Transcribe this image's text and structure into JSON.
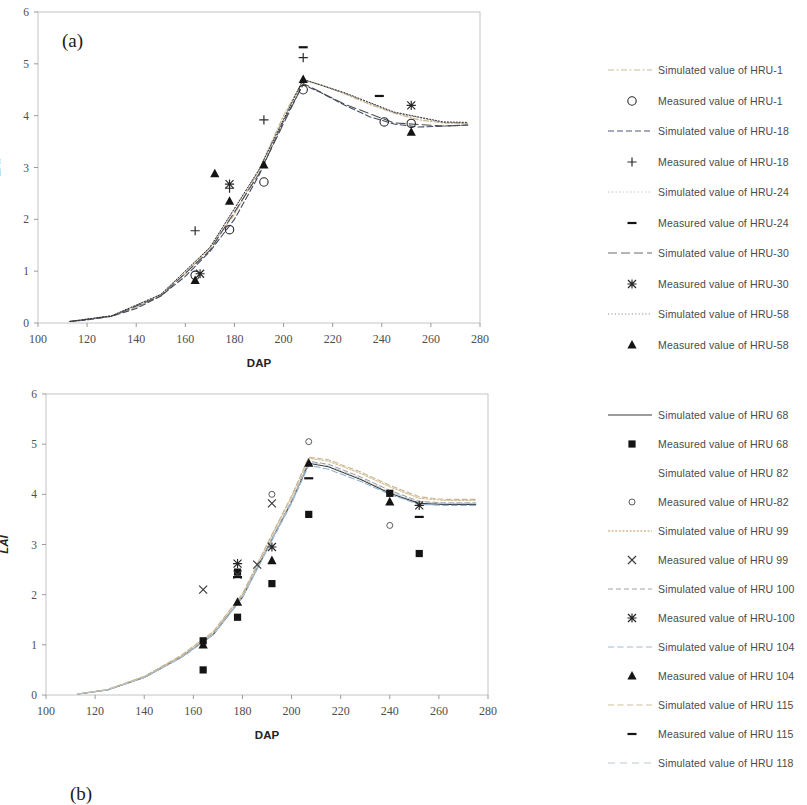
{
  "figure": {
    "panels": [
      {
        "tag": "(a)",
        "xlabel": "DAP",
        "ylabel": "LAI",
        "ylabel_italic": false
      },
      {
        "tag": "(b)",
        "xlabel": "DAP",
        "ylabel": "LAI",
        "ylabel_italic": true
      }
    ]
  },
  "legend_a": {
    "items": [
      {
        "key": "line-dash-dot-light",
        "label": "Simulated value of HRU-1",
        "color": "#c8b48c"
      },
      {
        "key": "marker-open-circle",
        "label": "Measured value of HRU-1",
        "color": "#333333"
      },
      {
        "key": "line-dashed",
        "label": "Simulated value of HRU-18",
        "color": "#404a66"
      },
      {
        "key": "marker-plus",
        "label": "Measured value of HRU-18",
        "color": "#333333"
      },
      {
        "key": "line-dotted-faint",
        "label": "Simulated value of HRU-24",
        "color": "#bbbbbb"
      },
      {
        "key": "marker-dash",
        "label": "Measured value of HRU-24",
        "color": "#222222"
      },
      {
        "key": "line-long-dash",
        "label": "Simulated value of HRU-30",
        "color": "#5a5a5a"
      },
      {
        "key": "marker-asterisk",
        "label": "Measured value of HRU-30",
        "color": "#333333"
      },
      {
        "key": "line-dotted",
        "label": "Simulated value of HRU-58",
        "color": "#8a8a8a"
      },
      {
        "key": "marker-filled-triangle",
        "label": "Measured value of HRU-58",
        "color": "#111111"
      }
    ]
  },
  "legend_b": {
    "items": [
      {
        "key": "line-solid",
        "label": "Simulated value of HRU 68",
        "color": "#3a3a3a"
      },
      {
        "key": "marker-filled-square",
        "label": "Measured value of HRU 68",
        "color": "#111111"
      },
      {
        "key": "line-blank",
        "label": "Simulated value of HRU 82",
        "color": "#ffffff"
      },
      {
        "key": "marker-open-circle-small",
        "label": "Measured value of HRU-82",
        "color": "#555555"
      },
      {
        "key": "line-dotted-tan",
        "label": "Simulated value of HRU 99",
        "color": "#d2bb8e"
      },
      {
        "key": "marker-x",
        "label": "Measured value of HRU 99",
        "color": "#555555"
      },
      {
        "key": "line-dashed-grey",
        "label": "Simulated value of HRU 100",
        "color": "#9a9a9a"
      },
      {
        "key": "marker-asterisk",
        "label": "Measured value of HRU-100",
        "color": "#333333"
      },
      {
        "key": "line-dashed-blue",
        "label": "Simulated value of HRU 104",
        "color": "#8fb4cf"
      },
      {
        "key": "marker-filled-triangle",
        "label": "Measured value of HRU 104",
        "color": "#111111"
      },
      {
        "key": "line-dashed-tan",
        "label": "Simulated value of HRU 115",
        "color": "#cbb893"
      },
      {
        "key": "marker-dash",
        "label": "Measured value of HRU 115",
        "color": "#111111"
      },
      {
        "key": "line-dashed-light",
        "label": "Simulated value of HRU 118",
        "color": "#b9c6cf"
      }
    ]
  },
  "chart_data": [
    {
      "id": "panel-a",
      "type": "line",
      "title": "(a)",
      "xlabel": "DAP",
      "ylabel": "LAI",
      "xlim": [
        100,
        280
      ],
      "ylim": [
        0,
        6
      ],
      "xticks": [
        100,
        120,
        140,
        160,
        180,
        200,
        220,
        240,
        260,
        280
      ],
      "yticks": [
        0,
        1,
        2,
        3,
        4,
        5,
        6
      ],
      "grid": false,
      "legend_position": "right",
      "series": [
        {
          "name": "Simulated value of HRU-1",
          "style": "line",
          "x": [
            113,
            120,
            130,
            140,
            150,
            160,
            170,
            180,
            190,
            200,
            208,
            215,
            225,
            235,
            245,
            255,
            265,
            275
          ],
          "y": [
            0.03,
            0.06,
            0.14,
            0.3,
            0.55,
            0.95,
            1.45,
            2.1,
            2.95,
            4.0,
            4.68,
            4.6,
            4.42,
            4.22,
            4.05,
            3.92,
            3.86,
            3.85
          ]
        },
        {
          "name": "Simulated value of HRU-18",
          "style": "line",
          "x": [
            113,
            120,
            130,
            140,
            150,
            160,
            170,
            180,
            190,
            200,
            208,
            215,
            225,
            235,
            245,
            255,
            265,
            275
          ],
          "y": [
            0.03,
            0.06,
            0.13,
            0.28,
            0.52,
            0.9,
            1.38,
            2.0,
            2.85,
            3.9,
            4.6,
            4.45,
            4.2,
            3.98,
            3.84,
            3.78,
            3.8,
            3.82
          ]
        },
        {
          "name": "Simulated value of HRU-24",
          "style": "line",
          "x": [
            113,
            130,
            150,
            170,
            190,
            208,
            225,
            245,
            265,
            275
          ],
          "y": [
            0.03,
            0.14,
            0.55,
            1.45,
            2.95,
            4.7,
            4.43,
            4.06,
            3.87,
            3.86
          ]
        },
        {
          "name": "Simulated value of HRU-30",
          "style": "line",
          "x": [
            113,
            130,
            150,
            170,
            190,
            208,
            225,
            245,
            265,
            275
          ],
          "y": [
            0.03,
            0.13,
            0.52,
            1.4,
            2.88,
            4.62,
            4.22,
            3.86,
            3.8,
            3.82
          ]
        },
        {
          "name": "Simulated value of HRU-58",
          "style": "line",
          "x": [
            113,
            130,
            150,
            170,
            190,
            208,
            225,
            245,
            265,
            275
          ],
          "y": [
            0.03,
            0.14,
            0.55,
            1.46,
            2.96,
            4.7,
            4.44,
            4.07,
            3.88,
            3.87
          ]
        },
        {
          "name": "Measured value of HRU-1",
          "style": "marker",
          "marker": "open-circle",
          "x": [
            164,
            178,
            192,
            208,
            241,
            252
          ],
          "y": [
            0.92,
            1.8,
            2.72,
            4.5,
            3.88,
            3.85
          ]
        },
        {
          "name": "Measured value of HRU-18",
          "style": "marker",
          "marker": "plus",
          "x": [
            164,
            178,
            192,
            208
          ],
          "y": [
            1.78,
            2.6,
            3.92,
            5.12
          ]
        },
        {
          "name": "Measured value of HRU-24",
          "style": "marker",
          "marker": "dash",
          "x": [
            208,
            239
          ],
          "y": [
            5.32,
            4.38
          ]
        },
        {
          "name": "Measured value of HRU-30",
          "style": "marker",
          "marker": "asterisk",
          "x": [
            166,
            178,
            252
          ],
          "y": [
            0.95,
            2.68,
            4.2
          ]
        },
        {
          "name": "Measured value of HRU-58",
          "style": "marker",
          "marker": "filled-triangle",
          "x": [
            164,
            172,
            178,
            192,
            208,
            252
          ],
          "y": [
            0.82,
            2.88,
            2.35,
            3.05,
            4.7,
            3.68
          ]
        }
      ]
    },
    {
      "id": "panel-b",
      "type": "line",
      "title": "(b)",
      "xlabel": "DAP",
      "ylabel": "LAI",
      "xlim": [
        100,
        280
      ],
      "ylim": [
        0,
        6
      ],
      "xticks": [
        100,
        120,
        140,
        160,
        180,
        200,
        220,
        240,
        260,
        280
      ],
      "yticks": [
        0,
        1,
        2,
        3,
        4,
        5,
        6
      ],
      "grid": false,
      "legend_position": "right",
      "series": [
        {
          "name": "Simulated value of HRU 68",
          "style": "line",
          "x": [
            113,
            125,
            140,
            155,
            168,
            180,
            192,
            200,
            207,
            215,
            228,
            240,
            252,
            262,
            275
          ],
          "y": [
            0.02,
            0.1,
            0.35,
            0.75,
            1.2,
            1.95,
            3.1,
            3.85,
            4.62,
            4.55,
            4.3,
            4.02,
            3.82,
            3.8,
            3.8
          ]
        },
        {
          "name": "Simulated value of HRU 99",
          "style": "line",
          "x": [
            113,
            125,
            140,
            155,
            168,
            180,
            192,
            200,
            207,
            215,
            228,
            240,
            252,
            262,
            275
          ],
          "y": [
            0.02,
            0.11,
            0.37,
            0.78,
            1.25,
            2.0,
            3.18,
            3.95,
            4.72,
            4.66,
            4.42,
            4.15,
            3.92,
            3.88,
            3.88
          ]
        },
        {
          "name": "Simulated value of HRU 100",
          "style": "line",
          "x": [
            113,
            125,
            140,
            155,
            168,
            180,
            192,
            200,
            207,
            215,
            228,
            240,
            252,
            262,
            275
          ],
          "y": [
            0.02,
            0.1,
            0.36,
            0.76,
            1.22,
            1.97,
            3.12,
            3.88,
            4.66,
            4.6,
            4.35,
            4.08,
            3.86,
            3.83,
            3.83
          ]
        },
        {
          "name": "Simulated value of HRU 104",
          "style": "line",
          "x": [
            113,
            125,
            140,
            155,
            168,
            180,
            192,
            200,
            207,
            215,
            228,
            240,
            252,
            262,
            275
          ],
          "y": [
            0.02,
            0.1,
            0.35,
            0.74,
            1.2,
            1.94,
            3.08,
            3.82,
            4.58,
            4.5,
            4.26,
            4.0,
            3.8,
            3.78,
            3.78
          ]
        },
        {
          "name": "Simulated value of HRU 115",
          "style": "line",
          "x": [
            113,
            125,
            140,
            155,
            168,
            180,
            192,
            200,
            207,
            215,
            228,
            240,
            252,
            262,
            275
          ],
          "y": [
            0.02,
            0.11,
            0.37,
            0.79,
            1.26,
            2.02,
            3.2,
            3.97,
            4.74,
            4.69,
            4.45,
            4.18,
            3.95,
            3.9,
            3.9
          ]
        },
        {
          "name": "Simulated value of HRU 118",
          "style": "line",
          "x": [
            113,
            125,
            140,
            155,
            168,
            180,
            192,
            200,
            207,
            215,
            228,
            240,
            252,
            262,
            275
          ],
          "y": [
            0.02,
            0.1,
            0.35,
            0.75,
            1.2,
            1.95,
            3.1,
            3.86,
            4.64,
            4.57,
            4.32,
            4.05,
            3.84,
            3.82,
            3.82
          ]
        },
        {
          "name": "Measured value of HRU 68",
          "style": "marker",
          "marker": "filled-square",
          "x": [
            164,
            164,
            178,
            178,
            192,
            207,
            240,
            252
          ],
          "y": [
            1.08,
            0.5,
            2.45,
            1.55,
            2.22,
            3.6,
            4.02,
            2.82
          ]
        },
        {
          "name": "Measured value of HRU-82",
          "style": "marker",
          "marker": "open-circle-small",
          "x": [
            192,
            207,
            240
          ],
          "y": [
            4.0,
            5.05,
            3.38
          ]
        },
        {
          "name": "Measured value of HRU 99",
          "style": "marker",
          "marker": "x",
          "x": [
            164,
            178,
            186,
            192
          ],
          "y": [
            2.1,
            2.4,
            2.6,
            3.82
          ]
        },
        {
          "name": "Measured value of HRU-100",
          "style": "marker",
          "marker": "asterisk",
          "x": [
            178,
            192,
            252
          ],
          "y": [
            2.62,
            2.95,
            3.78
          ]
        },
        {
          "name": "Measured value of HRU 104",
          "style": "marker",
          "marker": "filled-triangle",
          "x": [
            164,
            178,
            192,
            207,
            240
          ],
          "y": [
            1.0,
            1.85,
            2.68,
            4.62,
            3.85
          ]
        },
        {
          "name": "Measured value of HRU 115",
          "style": "marker",
          "marker": "dash",
          "x": [
            178,
            207,
            252
          ],
          "y": [
            2.35,
            4.32,
            3.55
          ]
        }
      ]
    }
  ]
}
